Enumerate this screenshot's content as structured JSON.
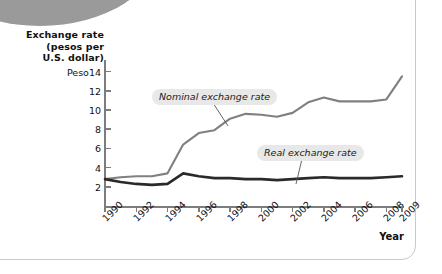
{
  "figure": {
    "y_axis_title": "Exchange rate\n(pesos per\nU.S. dollar)",
    "y_axis_title_lines": [
      "Exchange rate",
      "(pesos per",
      "U.S. dollar)"
    ],
    "x_axis_title": "Year",
    "first_y_tick_prefix": "Peso"
  },
  "annotations": {
    "nominal_label": "Nominal exchange rate",
    "real_label": "Real exchange rate"
  },
  "colors": {
    "nominal_line": "#808080",
    "real_line": "#2a2a2a",
    "axis": "#7d7d7d",
    "callout_bg": "#e8e8e8",
    "blob": "#9a9a9a",
    "border": "#c9c9c9",
    "text": "#111111"
  },
  "chart_data": {
    "type": "line",
    "title": "",
    "xlabel": "Year",
    "ylabel": "Exchange rate (pesos per U.S. dollar)",
    "xlim": [
      1990,
      2009
    ],
    "ylim": [
      0,
      15
    ],
    "ytick_values": [
      2,
      4,
      6,
      8,
      10,
      12,
      14
    ],
    "ytick_labels": [
      "2",
      "4",
      "6",
      "8",
      "10",
      "12",
      "Peso14"
    ],
    "xtick_values": [
      1990,
      1992,
      1994,
      1996,
      1998,
      2000,
      2002,
      2004,
      2006,
      2008,
      2009
    ],
    "xtick_labels": [
      "1990",
      "1992",
      "1994",
      "1996",
      "1998",
      "2000",
      "2002",
      "2004",
      "2006",
      "2008",
      "2009"
    ],
    "grid": false,
    "legend": "annotated-callouts",
    "x": [
      1990,
      1991,
      1992,
      1993,
      1994,
      1995,
      1996,
      1997,
      1998,
      1999,
      2000,
      2001,
      2002,
      2003,
      2004,
      2005,
      2006,
      2007,
      2008,
      2009
    ],
    "series": [
      {
        "name": "Nominal exchange rate",
        "color": "#808080",
        "values": [
          2.8,
          3.0,
          3.1,
          3.1,
          3.4,
          6.4,
          7.6,
          7.9,
          9.1,
          9.6,
          9.5,
          9.3,
          9.7,
          10.8,
          11.3,
          10.9,
          10.9,
          10.9,
          11.1,
          13.5
        ]
      },
      {
        "name": "Real exchange rate",
        "color": "#2a2a2a",
        "values": [
          2.8,
          2.5,
          2.3,
          2.2,
          2.3,
          3.4,
          3.1,
          2.9,
          2.9,
          2.8,
          2.8,
          2.7,
          2.8,
          2.9,
          3.0,
          2.9,
          2.9,
          2.9,
          3.0,
          3.1
        ]
      }
    ]
  }
}
